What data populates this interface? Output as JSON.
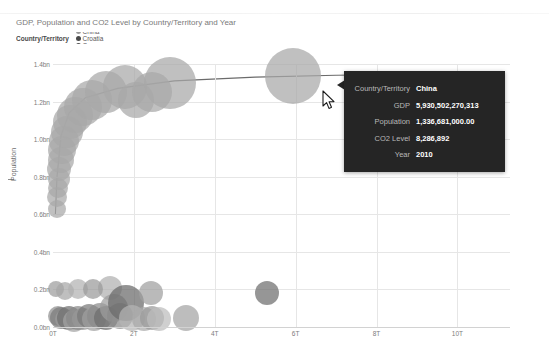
{
  "page": {
    "ghost_header": ""
  },
  "chart": {
    "title": "GDP, Population and CO2 Level by Country/Territory and Year",
    "bubble_color": "#a8a8a8",
    "trendline_color": "#6b6b6b",
    "gridline_color": "#e6e6e6"
  },
  "legend": {
    "title": "Country/Territory",
    "items": [
      {
        "label": "Argentina",
        "color": "#b0b0b0"
      },
      {
        "label": "Australia",
        "color": "#4f4f4f"
      },
      {
        "label": "Austria",
        "color": "#a5a5a5"
      },
      {
        "label": "Belgium",
        "color": "#c4c4c4"
      },
      {
        "label": "Brazil",
        "color": "#3d3d3d"
      },
      {
        "label": "Canada",
        "color": "#bdbdbd"
      },
      {
        "label": "China",
        "color": "#9a9a9a"
      },
      {
        "label": "Croatia",
        "color": "#4a4a4a"
      },
      {
        "label": "Cyprus",
        "color": "#555555"
      },
      {
        "label": "Czech Republic",
        "color": "#b8b8b8"
      },
      {
        "label": "Denmark",
        "color": "#9e9e9e"
      },
      {
        "label": "Estonia",
        "color": "#3f3f3f"
      },
      {
        "label": "Finland",
        "color": "#8f8f8f"
      },
      {
        "label": "France",
        "color": "#c0c0c0"
      },
      {
        "label": "G",
        "color": "#4b4b4b"
      }
    ]
  },
  "tooltip": {
    "rows": [
      {
        "key": "Country/Territory",
        "value": "China"
      },
      {
        "key": "GDP",
        "value": "5,930,502,270,313"
      },
      {
        "key": "Population",
        "value": "1,336,681,000.00"
      },
      {
        "key": "CO2 Level",
        "value": "8,286,892"
      },
      {
        "key": "Year",
        "value": "2010"
      }
    ]
  },
  "chart_data": {
    "type": "scatter",
    "title": "GDP, Population and CO2 Level by Country/Territory and Year",
    "xlabel": "GDP",
    "ylabel": "Population",
    "xlim": [
      0,
      11.3
    ],
    "ylim": [
      0,
      1.4
    ],
    "xticks": [
      "0T",
      "2T",
      "4T",
      "6T",
      "8T",
      "10T"
    ],
    "xtick_values": [
      0,
      2,
      4,
      6,
      8,
      10
    ],
    "yticks": [
      "0.0bn",
      "0.2bn",
      "0.4bn",
      "0.6bn",
      "0.8bn",
      "1.0bn",
      "1.2bn",
      "1.4bn"
    ],
    "ytick_values": [
      0.0,
      0.2,
      0.4,
      0.6,
      0.8,
      1.0,
      1.2,
      1.4
    ],
    "grid": true,
    "legend_position": "top",
    "size_encoding": "CO2 Level",
    "highlighted_point": {
      "x": 5.93,
      "y": 1.3367,
      "size": 8286892,
      "label": "China",
      "year": 2010
    },
    "points": [
      {
        "x": 0.09,
        "y": 0.63,
        "r": 9,
        "c": "#a8a8a8"
      },
      {
        "x": 0.11,
        "y": 0.69,
        "r": 10,
        "c": "#a8a8a8"
      },
      {
        "x": 0.12,
        "y": 0.74,
        "r": 10,
        "c": "#a8a8a8"
      },
      {
        "x": 0.14,
        "y": 0.79,
        "r": 11,
        "c": "#a8a8a8"
      },
      {
        "x": 0.16,
        "y": 0.84,
        "r": 12,
        "c": "#a8a8a8"
      },
      {
        "x": 0.19,
        "y": 0.89,
        "r": 13,
        "c": "#a8a8a8"
      },
      {
        "x": 0.23,
        "y": 0.94,
        "r": 14,
        "c": "#a8a8a8"
      },
      {
        "x": 0.27,
        "y": 0.99,
        "r": 15,
        "c": "#a8a8a8"
      },
      {
        "x": 0.34,
        "y": 1.04,
        "r": 16,
        "c": "#a8a8a8"
      },
      {
        "x": 0.42,
        "y": 1.09,
        "r": 17,
        "c": "#a8a8a8"
      },
      {
        "x": 0.55,
        "y": 1.13,
        "r": 18,
        "c": "#a8a8a8"
      },
      {
        "x": 0.73,
        "y": 1.17,
        "r": 19,
        "c": "#a8a8a8"
      },
      {
        "x": 0.97,
        "y": 1.21,
        "r": 20,
        "c": "#a8a8a8"
      },
      {
        "x": 1.32,
        "y": 1.25,
        "r": 21,
        "c": "#a8a8a8"
      },
      {
        "x": 1.77,
        "y": 1.28,
        "r": 22,
        "c": "#a8a8a8"
      },
      {
        "x": 2.05,
        "y": 1.21,
        "r": 18,
        "c": "#a8a8a8"
      },
      {
        "x": 2.46,
        "y": 1.25,
        "r": 20,
        "c": "#a8a8a8"
      },
      {
        "x": 2.9,
        "y": 1.3,
        "r": 26,
        "c": "#a8a8a8"
      },
      {
        "x": 5.93,
        "y": 1.337,
        "r": 28,
        "c": "#a8a8a8"
      },
      {
        "x": 0.12,
        "y": 0.06,
        "r": 10,
        "c": "#8f8f8f"
      },
      {
        "x": 0.2,
        "y": 0.05,
        "r": 11,
        "c": "#7b7b7b"
      },
      {
        "x": 0.3,
        "y": 0.04,
        "r": 10,
        "c": "#9b9b9b"
      },
      {
        "x": 0.4,
        "y": 0.05,
        "r": 12,
        "c": "#6f6f6f"
      },
      {
        "x": 0.52,
        "y": 0.03,
        "r": 11,
        "c": "#a4a4a4"
      },
      {
        "x": 0.62,
        "y": 0.05,
        "r": 12,
        "c": "#888888"
      },
      {
        "x": 0.75,
        "y": 0.04,
        "r": 11,
        "c": "#979797"
      },
      {
        "x": 0.9,
        "y": 0.06,
        "r": 12,
        "c": "#787878"
      },
      {
        "x": 1.02,
        "y": 0.04,
        "r": 12,
        "c": "#a0a0a0"
      },
      {
        "x": 1.15,
        "y": 0.06,
        "r": 13,
        "c": "#8b8b8b"
      },
      {
        "x": 1.3,
        "y": 0.05,
        "r": 12,
        "c": "#6d6d6d"
      },
      {
        "x": 1.42,
        "y": 0.21,
        "r": 12,
        "c": "#b0b0b0"
      },
      {
        "x": 1.5,
        "y": 0.1,
        "r": 14,
        "c": "#9d9d9d"
      },
      {
        "x": 1.66,
        "y": 0.06,
        "r": 13,
        "c": "#8a8a8a"
      },
      {
        "x": 1.8,
        "y": 0.13,
        "r": 18,
        "c": "#6a6a6a"
      },
      {
        "x": 1.95,
        "y": 0.05,
        "r": 13,
        "c": "#b4b4b4"
      },
      {
        "x": 2.25,
        "y": 0.04,
        "r": 12,
        "c": "#a9a9a9"
      },
      {
        "x": 2.45,
        "y": 0.05,
        "r": 12,
        "c": "#9a9a9a"
      },
      {
        "x": 2.62,
        "y": 0.04,
        "r": 12,
        "c": "#bcbcbc"
      },
      {
        "x": 2.42,
        "y": 0.18,
        "r": 12,
        "c": "#9f9f9f"
      },
      {
        "x": 3.3,
        "y": 0.05,
        "r": 13,
        "c": "#a3a3a3"
      },
      {
        "x": 5.3,
        "y": 0.18,
        "r": 12,
        "c": "#6e6e6e"
      },
      {
        "x": 0.08,
        "y": 0.2,
        "r": 8,
        "c": "#9c9c9c"
      },
      {
        "x": 0.3,
        "y": 0.19,
        "r": 9,
        "c": "#a6a6a6"
      },
      {
        "x": 0.62,
        "y": 0.2,
        "r": 10,
        "c": "#b2b2b2"
      },
      {
        "x": 1.0,
        "y": 0.2,
        "r": 10,
        "c": "#9a9a9a"
      }
    ],
    "trendline": [
      {
        "x": 0.06,
        "y": 0.6
      },
      {
        "x": 0.1,
        "y": 0.8
      },
      {
        "x": 0.2,
        "y": 1.02
      },
      {
        "x": 0.4,
        "y": 1.14
      },
      {
        "x": 0.8,
        "y": 1.22
      },
      {
        "x": 1.6,
        "y": 1.27
      },
      {
        "x": 3.0,
        "y": 1.31
      },
      {
        "x": 5.0,
        "y": 1.33
      },
      {
        "x": 7.0,
        "y": 1.34
      },
      {
        "x": 9.0,
        "y": 1.345
      },
      {
        "x": 11.0,
        "y": 1.35
      }
    ]
  }
}
